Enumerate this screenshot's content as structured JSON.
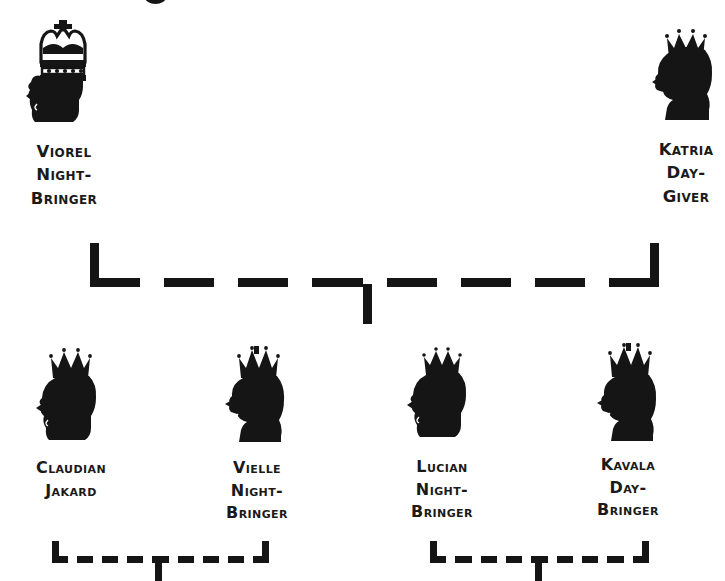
{
  "diagram": {
    "type": "family-tree",
    "background_color": "#ffffff",
    "ink_color": "#151515",
    "generations": 2
  },
  "people": {
    "viorel": {
      "name_lines": "Viorel\nNight-\nBringer",
      "full_name": "Viorel Night-Bringer",
      "portrait": "crowned-male-silhouette-icon",
      "crown": "tall-arched-crown",
      "facing": "left",
      "generation": "root"
    },
    "katria": {
      "name_lines": "Katria\nDay-\nGiver",
      "full_name": "Katria Day-Giver",
      "portrait": "crowned-female-silhouette-icon",
      "crown": "small-spiked-tiara",
      "facing": "left",
      "generation": "root"
    },
    "claudian": {
      "name_lines": "Claudian\nJakard",
      "full_name": "Claudian Jakard",
      "portrait": "crowned-male-silhouette-icon",
      "crown": "spiked-crown",
      "facing": "left",
      "generation": "child"
    },
    "vielle": {
      "name_lines": "Vielle\nNight-\nBringer",
      "full_name": "Vielle Night-Bringer",
      "portrait": "crowned-female-silhouette-icon",
      "crown": "spiked-crown",
      "facing": "left",
      "generation": "child"
    },
    "lucian": {
      "name_lines": "Lucian\nNight-\nBringer",
      "full_name": "Lucian Night-Bringer",
      "portrait": "crowned-male-silhouette-icon",
      "crown": "spiked-crown",
      "facing": "left",
      "generation": "child"
    },
    "kavala": {
      "name_lines": "Kavala\nDay-\nBringer",
      "full_name": "Kavala Day-Bringer",
      "portrait": "crowned-female-silhouette-icon",
      "crown": "spiked-crown",
      "facing": "left",
      "generation": "child"
    }
  },
  "connectors": {
    "marriage_root": {
      "label": "Viorel + Katria marriage bracket",
      "style": "dashed",
      "thickness": 9,
      "left_x": 90,
      "right_x": 650,
      "bar_y": 281,
      "stub_top_y": 243,
      "drop_x": 367,
      "drop_bottom_y": 322
    },
    "marriage_left_children": {
      "label": "Claudian + Vielle marriage bracket",
      "style": "dashed",
      "thickness": 7,
      "left_x": 52,
      "right_x": 268,
      "bar_y": 556,
      "stub_top_y": 540,
      "drop_x": 158,
      "drop_bottom_y": 581
    },
    "marriage_right_children": {
      "label": "Lucian + Kavala marriage bracket",
      "style": "dashed",
      "thickness": 7,
      "left_x": 430,
      "right_x": 648,
      "bar_y": 556,
      "stub_top_y": 540,
      "drop_x": 538,
      "drop_bottom_y": 581
    }
  }
}
